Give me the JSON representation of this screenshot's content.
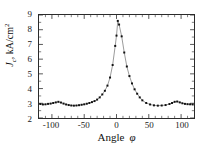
{
  "chart_data": {
    "type": "line",
    "title": "",
    "subtitle": "",
    "xlabel": "Angle",
    "xlabel_symbol": "φ",
    "ylabel": "J_c, kA/cm^2",
    "ylabel_parts": {
      "symbol": "J",
      "subscript": "c",
      "separator": ", ",
      "unit_main": "kA/cm",
      "unit_sup": "2"
    },
    "xlim": [
      -120,
      120
    ],
    "ylim": [
      2,
      9
    ],
    "xticks": [
      -100,
      -50,
      0,
      50,
      100
    ],
    "xtick_labels": [
      "-100",
      "-50",
      "0",
      "50",
      "100"
    ],
    "yticks": [
      2,
      3,
      4,
      5,
      6,
      7,
      8,
      9
    ],
    "ytick_labels": [
      "2",
      "3",
      "4",
      "5",
      "6",
      "7",
      "8",
      "9"
    ],
    "x_minor_ticks": [
      -110,
      -90,
      -80,
      -70,
      -60,
      -40,
      -30,
      -20,
      -10,
      10,
      20,
      30,
      40,
      60,
      70,
      80,
      90,
      110
    ],
    "y_minor_ticks": [
      2.5,
      3.5,
      4.5,
      5.5,
      6.5,
      7.5,
      8.5
    ],
    "grid": false,
    "legend": null,
    "legend_position": "none",
    "marker": "square",
    "marker_color": "#111111",
    "line_color": "#555555",
    "frame_color": "#2b2b2b",
    "background": "#ffffff",
    "series": [
      {
        "name": "Jc vs angle",
        "x": [
          -118,
          -114,
          -110,
          -106,
          -102,
          -98,
          -94,
          -90,
          -86,
          -82,
          -78,
          -74,
          -70,
          -66,
          -62,
          -58,
          -54,
          -50,
          -46,
          -42,
          -38,
          -34,
          -30,
          -26,
          -22,
          -18,
          -14,
          -10,
          -6,
          -2,
          0,
          2,
          4,
          8,
          12,
          16,
          20,
          24,
          28,
          32,
          36,
          40,
          46,
          52,
          58,
          64,
          70,
          76,
          82,
          86,
          90,
          94,
          98,
          102,
          106,
          110,
          114,
          118
        ],
        "values": [
          2.95,
          2.92,
          2.93,
          2.96,
          2.98,
          3.02,
          3.06,
          3.1,
          3.05,
          2.98,
          2.92,
          2.88,
          2.85,
          2.84,
          2.85,
          2.87,
          2.9,
          2.93,
          2.97,
          3.02,
          3.08,
          3.15,
          3.25,
          3.4,
          3.6,
          3.85,
          4.2,
          4.75,
          5.6,
          6.9,
          7.6,
          8.6,
          8.35,
          7.55,
          6.45,
          5.5,
          4.85,
          4.35,
          3.95,
          3.65,
          3.4,
          3.2,
          3.02,
          2.92,
          2.86,
          2.84,
          2.85,
          2.88,
          2.95,
          3.02,
          3.1,
          3.12,
          3.06,
          3.0,
          2.96,
          2.94,
          2.93,
          2.92
        ]
      }
    ],
    "peak": {
      "x": 0,
      "y": 8.6,
      "label": "peak at phi = 0"
    },
    "baseline_level": 2.9,
    "side_bump_levels": [
      3.1,
      3.12
    ],
    "side_bump_positions": [
      -90,
      90
    ]
  },
  "figure": {
    "width": 212,
    "height": 149
  }
}
